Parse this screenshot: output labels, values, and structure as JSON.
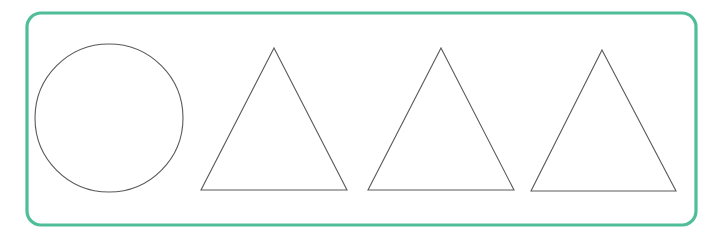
{
  "canvas": {
    "width": 705,
    "height": 237,
    "background_color": "#ffffff",
    "title": "Shapes worksheet frame"
  },
  "frame": {
    "label": "Green rounded rectangle frame",
    "stroke_color": "#4fbd98",
    "stroke_width": 3.2,
    "fill": "none",
    "x": 27,
    "y": 13,
    "width": 669,
    "height": 212,
    "corner_radius": 14
  },
  "shape_style": {
    "stroke_color": "#5a5a5a",
    "stroke_width": 1.1,
    "fill": "none"
  },
  "shapes": [
    {
      "id": "shape-1",
      "type": "circle",
      "name": "circle",
      "center_x": 109,
      "center_y": 118,
      "radius_x": 74,
      "radius_y": 74
    },
    {
      "id": "shape-2",
      "type": "triangle",
      "name": "triangle-1",
      "apex_x": 274,
      "apex_y": 48,
      "base_left_x": 201,
      "base_right_x": 347,
      "base_y": 190
    },
    {
      "id": "shape-3",
      "type": "triangle",
      "name": "triangle-2",
      "apex_x": 441,
      "apex_y": 48,
      "base_left_x": 368,
      "base_right_x": 514,
      "base_y": 190
    },
    {
      "id": "shape-4",
      "type": "triangle",
      "name": "triangle-3",
      "apex_x": 602,
      "apex_y": 50,
      "base_left_x": 531,
      "base_right_x": 676,
      "base_y": 191
    }
  ]
}
